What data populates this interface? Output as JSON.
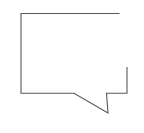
{
  "canvas": {
    "width": 144,
    "height": 133,
    "background_color": "#ffffff",
    "title": "Speech bubble outline"
  },
  "drawing": {
    "name": "speech-bubble-outline",
    "description": "Open hand-drawn polyline outlining a rectangular speech bubble with a pointed tail at the lower right",
    "stroke_color": "#5a5a5a",
    "stroke_width": 1.1,
    "fill": "none",
    "line_cap": "butt",
    "line_join": "miter",
    "path": "M 119.5 13.5 L 21 13.5 L 21 93.2 L 74 93.2 L 108 113 L 106.5 93.2 L 127 93.2 L 127 67",
    "vertices": [
      {
        "name": "top-right-open-end",
        "x": 119.5,
        "y": 13.5
      },
      {
        "name": "top-left-corner",
        "x": 21,
        "y": 13.5
      },
      {
        "name": "bottom-left-corner",
        "x": 21,
        "y": 93.2
      },
      {
        "name": "tail-base-left",
        "x": 74,
        "y": 93.2
      },
      {
        "name": "tail-tip",
        "x": 108,
        "y": 113
      },
      {
        "name": "tail-base-right",
        "x": 106.5,
        "y": 93.2
      },
      {
        "name": "bottom-right-corner",
        "x": 127,
        "y": 93.2
      },
      {
        "name": "right-open-end",
        "x": 127,
        "y": 67
      }
    ],
    "segments": [
      {
        "name": "top-edge",
        "from": "top-right-open-end",
        "to": "top-left-corner",
        "orientation": "horizontal"
      },
      {
        "name": "left-edge",
        "from": "top-left-corner",
        "to": "bottom-left-corner",
        "orientation": "vertical"
      },
      {
        "name": "bottom-left-edge",
        "from": "bottom-left-corner",
        "to": "tail-base-left",
        "orientation": "horizontal"
      },
      {
        "name": "tail-leading-edge",
        "from": "tail-base-left",
        "to": "tail-tip",
        "orientation": "diagonal"
      },
      {
        "name": "tail-trailing-edge",
        "from": "tail-tip",
        "to": "tail-base-right",
        "orientation": "near-vertical"
      },
      {
        "name": "bottom-right-edge",
        "from": "tail-base-right",
        "to": "bottom-right-corner",
        "orientation": "horizontal"
      },
      {
        "name": "right-edge",
        "from": "bottom-right-corner",
        "to": "right-open-end",
        "orientation": "vertical"
      }
    ]
  }
}
